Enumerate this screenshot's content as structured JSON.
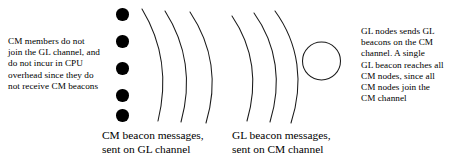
{
  "figure": {
    "background_color": "#ffffff",
    "stroke_color": "#1a1a1a",
    "node_color": "#000000"
  },
  "annotations": {
    "left_note": "CM members do not\njoin the GL channel, and\ndo not incur in CPU\n overhead since they do\nnot receive CM beacons",
    "right_note": "GL nodes sends GL\nbeacons on the CM\nchannel. A single\nGL beacon reaches all\nCM nodes, since all\nCM nodes join the\nCM channel"
  },
  "captions": {
    "cm_beacons": "CM beacon messages,\nsent on GL channel",
    "gl_beacons": "GL beacon messages,\nsent on CM channel"
  },
  "nodes": {
    "label": "CM member nodes",
    "count": 5,
    "dots": [
      {
        "name": "cm-node-1",
        "top": 2
      },
      {
        "name": "cm-node-2",
        "top": 29
      },
      {
        "name": "cm-node-3",
        "top": 56
      },
      {
        "name": "cm-node-4",
        "top": 83
      },
      {
        "name": "cm-node-5",
        "top": 103
      }
    ]
  },
  "waves": {
    "cm_group_label": "CM beacon wavefronts",
    "gl_group_label": "GL beacon wavefronts",
    "cm_arcs": [
      {
        "name": "cm-arc-1",
        "d": "M 142 9 C 162 42 168 80 158 121"
      },
      {
        "name": "cm-arc-2",
        "d": "M 165 11 C 186 44 192 82 181 122"
      },
      {
        "name": "cm-arc-3",
        "d": "M 190 12 C 212 45 218 83 206 123"
      }
    ],
    "gl_arcs": [
      {
        "name": "gl-arc-1",
        "d": "M 232 16 C 253 47 258 83 247 121"
      },
      {
        "name": "gl-arc-2",
        "d": "M 254 13 C 277 45 282 83 270 122"
      },
      {
        "name": "gl-arc-3",
        "d": "M 275 11 C 299 44 304 83 291 123"
      }
    ],
    "gl_node_circle": {
      "name": "gl-node-circle",
      "cx": 321.5,
      "cy": 61,
      "r": 19
    }
  }
}
